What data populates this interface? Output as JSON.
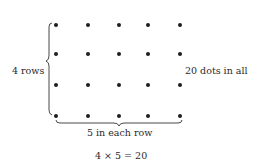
{
  "diagram": {
    "rows": 4,
    "cols": 5,
    "row_label": "4 rows",
    "col_label": "5 in each row",
    "total_label": "20 dots in all",
    "equation": "4 × 5 = 20",
    "dot_color": "#1e1e1e"
  }
}
